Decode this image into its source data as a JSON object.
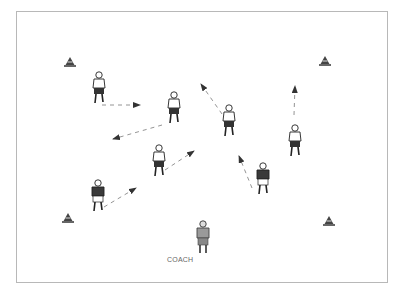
{
  "diagram": {
    "type": "soccer-drill",
    "labels": {
      "coach": "COACH"
    },
    "colors": {
      "border": "#b8b8b8",
      "dark_shirt": "#3a3a3a",
      "light_shirt": "#ffffff",
      "coach": "#9a9a9a",
      "arrow": "#555555",
      "cone": "#444444"
    },
    "cones": [
      {
        "id": "cone-top-left"
      },
      {
        "id": "cone-top-right"
      },
      {
        "id": "cone-bottom-left"
      },
      {
        "id": "cone-bottom-right"
      }
    ],
    "players": [
      {
        "id": "player-1",
        "team": "white"
      },
      {
        "id": "player-2",
        "team": "white"
      },
      {
        "id": "player-3",
        "team": "white"
      },
      {
        "id": "player-4",
        "team": "white"
      },
      {
        "id": "player-5",
        "team": "white"
      },
      {
        "id": "player-6",
        "team": "dark"
      },
      {
        "id": "player-7",
        "team": "dark"
      }
    ],
    "coach": {
      "id": "coach",
      "role": "coach"
    }
  }
}
